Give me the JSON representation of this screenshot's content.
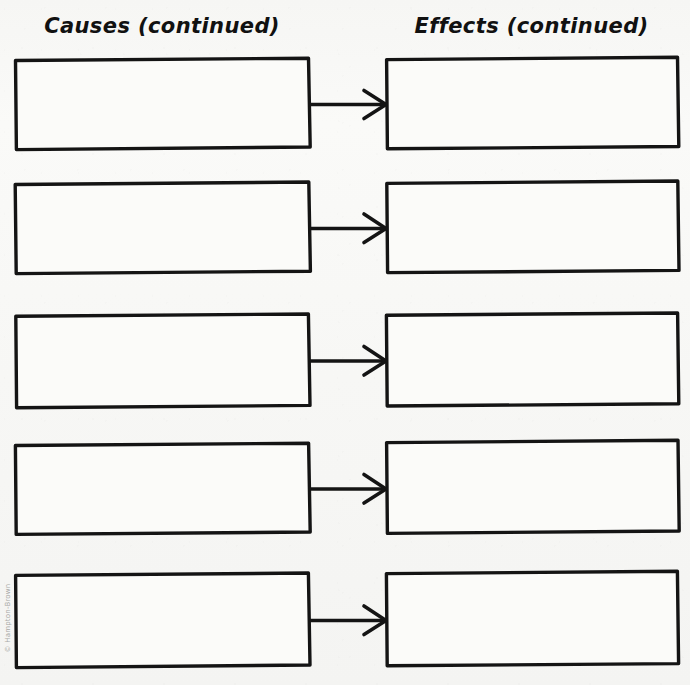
{
  "page": {
    "type": "graphic-organizer-worksheet",
    "background_color": "#f7f7f5",
    "ink_color": "#141414",
    "copyright": "© Hampton-Brown"
  },
  "columns": {
    "left": {
      "header": "Causes (continued)"
    },
    "right": {
      "header": "Effects (continued)"
    }
  },
  "rows": [
    {
      "index": 1,
      "cause_box": {
        "label": "",
        "placeholder": "",
        "x": 14,
        "y": 58,
        "w": 296,
        "h": 92
      },
      "arrow": {
        "name": "cause-effect-arrow",
        "from": "cause-box-1",
        "to": "effect-box-1",
        "y": 104
      },
      "effect_box": {
        "label": "",
        "placeholder": "",
        "x": 385,
        "y": 57,
        "w": 293,
        "h": 92
      }
    },
    {
      "index": 2,
      "cause_box": {
        "label": "",
        "placeholder": "",
        "x": 14,
        "y": 182,
        "w": 296,
        "h": 92
      },
      "arrow": {
        "name": "cause-effect-arrow",
        "from": "cause-box-2",
        "to": "effect-box-2",
        "y": 228
      },
      "effect_box": {
        "label": "",
        "placeholder": "",
        "x": 385,
        "y": 181,
        "w": 293,
        "h": 92
      }
    },
    {
      "index": 3,
      "cause_box": {
        "label": "",
        "placeholder": "",
        "x": 14,
        "y": 314,
        "w": 296,
        "h": 94
      },
      "arrow": {
        "name": "cause-effect-arrow",
        "from": "cause-box-3",
        "to": "effect-box-3",
        "y": 361
      },
      "effect_box": {
        "label": "",
        "placeholder": "",
        "x": 385,
        "y": 313,
        "w": 293,
        "h": 94
      }
    },
    {
      "index": 4,
      "cause_box": {
        "label": "",
        "placeholder": "",
        "x": 14,
        "y": 443,
        "w": 296,
        "h": 92
      },
      "arrow": {
        "name": "cause-effect-arrow",
        "from": "cause-box-4",
        "to": "effect-box-4",
        "y": 489
      },
      "effect_box": {
        "label": "",
        "placeholder": "",
        "x": 385,
        "y": 440,
        "w": 293,
        "h": 94
      }
    },
    {
      "index": 5,
      "cause_box": {
        "label": "",
        "placeholder": "",
        "x": 14,
        "y": 573,
        "w": 296,
        "h": 95
      },
      "arrow": {
        "name": "cause-effect-arrow",
        "from": "cause-box-5",
        "to": "effect-box-5",
        "y": 620
      },
      "effect_box": {
        "label": "",
        "placeholder": "",
        "x": 385,
        "y": 571,
        "w": 293,
        "h": 95
      }
    }
  ]
}
